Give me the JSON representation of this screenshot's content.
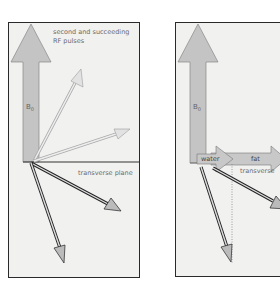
{
  "left_panel": {
    "caption_line1": "second and succeeding",
    "caption_line2": "RF pulses",
    "b0_label": "B",
    "b0_sub": "0",
    "plane_label": "transverse plane"
  },
  "right_panel": {
    "b0_label": "B",
    "b0_sub": "0",
    "water_label": "water",
    "fat_label": "fat",
    "plane_label": "transverse"
  },
  "colors": {
    "background": "#f1f1f0",
    "border": "#2a2a2a",
    "b0_fill": "#c4c4c4",
    "light_arrow": "#d6d6d6",
    "dark_arrow": "#3a3a3a",
    "text": "#6a6a6a"
  }
}
